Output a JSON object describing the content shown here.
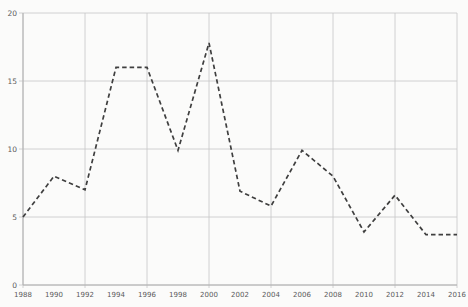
{
  "chart_data": {
    "type": "line",
    "title": "",
    "xlabel": "",
    "ylabel": "",
    "x": [
      1988,
      1990,
      1992,
      1994,
      1996,
      1998,
      2000,
      2002,
      2004,
      2006,
      2008,
      2010,
      2012,
      2014,
      2016
    ],
    "xtick_labels": [
      "1988",
      "1990",
      "1992",
      "1994",
      "1996",
      "1998",
      "2000",
      "2002",
      "2004",
      "2006",
      "2008",
      "2010",
      "2012",
      "2014",
      "2016"
    ],
    "series": [
      {
        "name": "dashed-series",
        "line_style": "dashed",
        "values": [
          5,
          8,
          7,
          16,
          16,
          9.9,
          17.8,
          6.9,
          5.8,
          9.9,
          8,
          3.9,
          6.6,
          3.7,
          3.7
        ]
      }
    ],
    "ylim": [
      0,
      20
    ],
    "yticks": [
      0,
      5,
      10,
      15,
      20
    ],
    "x_gridline_step": 2,
    "grid": "on",
    "legend": "none",
    "colors": {
      "line": "#3f3f3f",
      "grid": "#c7c7c7",
      "axis": "#b0b0b0",
      "labels": "#5a5a5a",
      "background": "#fbfbfa"
    },
    "layout": {
      "plot_left": 23,
      "plot_top": 13,
      "plot_right": 457,
      "plot_bottom": 285
    }
  }
}
